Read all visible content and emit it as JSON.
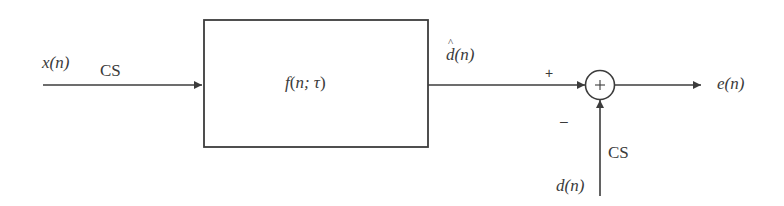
{
  "diagram": {
    "type": "block-diagram",
    "title": "",
    "input": {
      "signal": "x(n)",
      "annotation": "CS"
    },
    "block": {
      "label": "f(n; τ)",
      "fn": "f",
      "args": "n; τ"
    },
    "block_output": {
      "signal": "d(n)",
      "has_hat": true
    },
    "summing_junction": {
      "symbol": "+",
      "plus_input_sign": "+",
      "minus_input_sign": "–"
    },
    "reference": {
      "signal": "d(n)",
      "annotation": "CS"
    },
    "output": {
      "signal": "e(n)"
    },
    "colors": {
      "line": "#3c3c3c",
      "text": "#3a3a3a",
      "background": "#ffffff"
    }
  }
}
